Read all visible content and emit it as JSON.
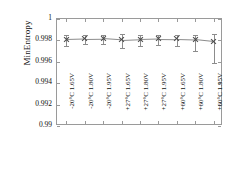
{
  "chart_data": {
    "type": "line",
    "title": "",
    "xlabel": "",
    "ylabel": "MinEntropy",
    "ylim": [
      0.99,
      1.0
    ],
    "ytick_labels": [
      "0.99",
      "0.992",
      "0.994",
      "0.996",
      "0.998",
      "1"
    ],
    "ytick_values": [
      0.99,
      0.992,
      0.994,
      0.996,
      0.998,
      1.0
    ],
    "grid": false,
    "legend": null,
    "marker": "x",
    "errorbars": true,
    "categories": [
      "-20°C 1.65V",
      "-20°C 1.80V",
      "-20°C 1.95V",
      "+27°C 1.65V",
      "+27°C 1.80V",
      "+27°C 1.95V",
      "+60°C 1.65V",
      "+60°C 1.80V",
      "+60°C 1.95V"
    ],
    "values": [
      0.9981,
      0.99815,
      0.99818,
      0.99806,
      0.99812,
      0.99816,
      0.99814,
      0.9981,
      0.99792
    ],
    "err_low": [
      0.99745,
      0.99762,
      0.9977,
      0.99728,
      0.99748,
      0.9976,
      0.99752,
      0.997,
      0.99588
    ],
    "err_high": [
      0.99852,
      0.9985,
      0.99852,
      0.99856,
      0.9985,
      0.9985,
      0.9985,
      0.99852,
      0.99856
    ]
  },
  "colors": {
    "axis": "#9a9a9a",
    "series": "#8c8c8c",
    "marker": "#4d4d4d",
    "text": "#111111",
    "background": "#ffffff"
  }
}
